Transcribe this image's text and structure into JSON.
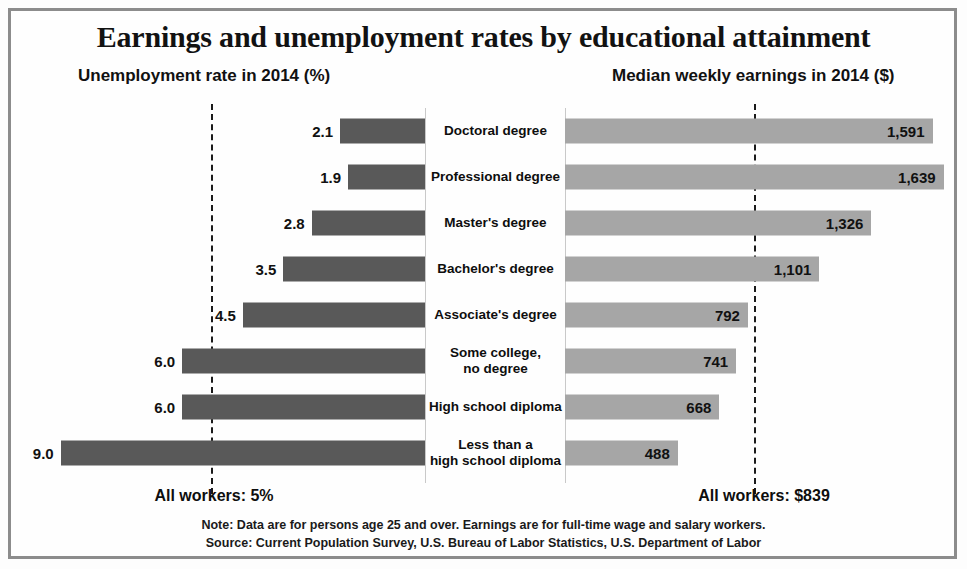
{
  "chart_title": "Earnings and unemployment rates by educational attainment",
  "headings": {
    "left": "Unemployment rate in 2014 (%)",
    "right": "Median weekly earnings in 2014 ($)"
  },
  "reference": {
    "left_label": "All workers: 5%",
    "right_label": "All workers: $839"
  },
  "footnotes": {
    "note": "Note: Data are for persons age 25 and over. Earnings are for full-time wage and salary workers.",
    "source": "Source: Current Population Survey, U.S. Bureau of Labor Statistics, U.S. Department of Labor"
  },
  "colors": {
    "unemployment_bar": "#595959",
    "earnings_bar": "#a6a6a6",
    "frame": "#8c8c8c",
    "reference_line": "#1a1a1a"
  },
  "chart_data": {
    "type": "bar",
    "subtype": "diverging-bar",
    "title": "Earnings and unemployment rates by educational attainment",
    "categories": [
      "Doctoral degree",
      "Professional degree",
      "Master's degree",
      "Bachelor's degree",
      "Associate's degree",
      "Some college,\nno degree",
      "High school diploma",
      "Less than a\nhigh school diploma"
    ],
    "series": [
      {
        "name": "Unemployment rate in 2014 (%)",
        "side": "left",
        "unit": "%",
        "values": [
          2.1,
          1.9,
          2.8,
          3.5,
          4.5,
          6.0,
          6.0,
          9.0
        ],
        "labels": [
          "2.1",
          "1.9",
          "2.8",
          "3.5",
          "4.5",
          "6.0",
          "6.0",
          "9.0"
        ],
        "reference_value": 5,
        "reference_label": "All workers: 5%",
        "axis_max": 10.5
      },
      {
        "name": "Median weekly earnings in 2014 ($)",
        "side": "right",
        "unit": "$",
        "values": [
          1591,
          1639,
          1326,
          1101,
          792,
          741,
          668,
          488
        ],
        "labels": [
          "1,591",
          "1,639",
          "1,326",
          "1,101",
          "792",
          "741",
          "668",
          "488"
        ],
        "reference_value": 839,
        "reference_label": "All workers: $839",
        "axis_max": 1740
      }
    ],
    "xlabel": "",
    "ylabel": "",
    "grid": false,
    "legend": "none",
    "annotations": [
      "Note: Data are for persons age 25 and over. Earnings are for full-time wage and salary workers.",
      "Source: Current Population Survey, U.S. Bureau of Labor Statistics, U.S. Department of Labor"
    ]
  }
}
